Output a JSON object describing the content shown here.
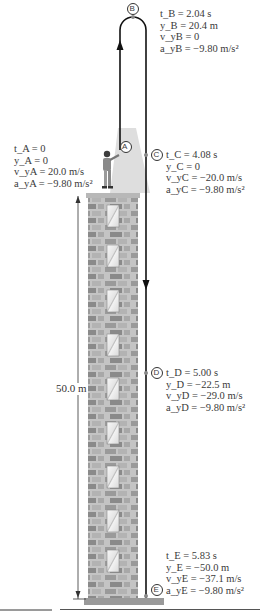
{
  "figure": {
    "building_height_label": "50.0 m",
    "points": {
      "A": {
        "marker": "A",
        "t": "t_A = 0",
        "y": "y_A = 0",
        "v": "v_yA = 20.0 m/s",
        "a": "a_yA = −9.80 m/s²"
      },
      "B": {
        "marker": "B",
        "t": "t_B = 2.04 s",
        "y": "y_B = 20.4 m",
        "v": "v_yB = 0",
        "a": "a_yB = −9.80 m/s²"
      },
      "C": {
        "marker": "C",
        "t": "t_C = 4.08 s",
        "y": "y_C = 0",
        "v": "v_yC = −20.0 m/s",
        "a": "a_yC = −9.80 m/s²"
      },
      "D": {
        "marker": "D",
        "t": "t_D = 5.00 s",
        "y": "y_D = −22.5 m",
        "v": "v_yD = −29.0 m/s",
        "a": "a_yD = −9.80 m/s²"
      },
      "E": {
        "marker": "E",
        "t": "t_E = 5.83 s",
        "y": "y_E = −50.0 m",
        "v": "v_yE = −37.1 m/s",
        "a": "a_yE = −9.80 m/s²"
      }
    },
    "colors": {
      "path": "#111111",
      "brick_light": "#c9c9c9",
      "brick_dark": "#8d8d8d",
      "window": "#f2f2f2",
      "ground": "#9a9a9a",
      "text": "#3a3a3a"
    }
  }
}
